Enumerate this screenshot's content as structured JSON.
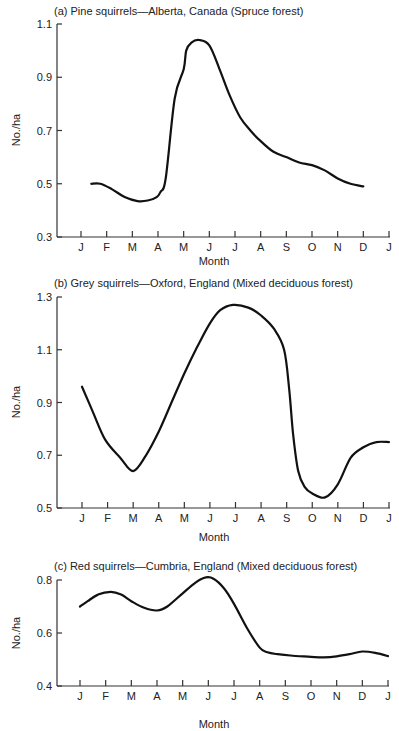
{
  "chart_data": [
    {
      "type": "line",
      "title": "(a)  Pine squirrels—Alberta, Canada (Spruce forest)",
      "xlabel": "Month",
      "ylabel": "No./ha",
      "categories": [
        "J",
        "F",
        "M",
        "A",
        "M",
        "J",
        "J",
        "A",
        "S",
        "O",
        "N",
        "D",
        "J"
      ],
      "ylim": [
        0.3,
        1.1
      ],
      "yticks": [
        "0.3",
        "0.5",
        "0.7",
        "0.9",
        "1.1"
      ],
      "grid": false,
      "x": [
        1.4,
        1.75,
        2.2,
        2.7,
        3.2,
        3.6,
        3.95,
        4.1,
        4.3,
        4.65,
        5.0,
        5.1,
        5.3,
        5.6,
        6.0,
        6.4,
        6.8,
        7.2,
        7.6,
        8.0,
        8.5,
        9.0,
        9.5,
        10.0,
        10.5,
        11.0,
        11.5,
        12.0
      ],
      "values": [
        0.5,
        0.5,
        0.48,
        0.45,
        0.435,
        0.437,
        0.45,
        0.47,
        0.52,
        0.82,
        0.93,
        1.0,
        1.03,
        1.04,
        1.02,
        0.93,
        0.83,
        0.75,
        0.7,
        0.66,
        0.62,
        0.6,
        0.58,
        0.57,
        0.55,
        0.52,
        0.5,
        0.49
      ],
      "frame": {
        "left": 57,
        "right": 390,
        "top": 24,
        "bottom": 237,
        "x_first": 81,
        "x_last": 389,
        "title_y": 15,
        "ticklabel_y": 251,
        "xlabel_y": 265,
        "ylabel_x": 16
      }
    },
    {
      "type": "line",
      "title": "(b)  Grey squirrels—Oxford, England (Mixed deciduous forest)",
      "xlabel": "Month",
      "ylabel": "No./ha",
      "categories": [
        "J",
        "F",
        "M",
        "A",
        "M",
        "J",
        "J",
        "A",
        "S",
        "O",
        "N",
        "D",
        "J"
      ],
      "ylim": [
        0.5,
        1.3
      ],
      "yticks": [
        "0.5",
        "0.7",
        "0.9",
        "1.1",
        "1.3"
      ],
      "grid": false,
      "x": [
        1.0,
        1.4,
        1.9,
        2.5,
        3.0,
        3.5,
        4.0,
        4.5,
        5.0,
        5.5,
        6.0,
        6.4,
        6.9,
        7.5,
        8.0,
        8.5,
        8.9,
        9.1,
        9.25,
        9.45,
        9.7,
        10.0,
        10.5,
        11.0,
        11.5,
        12.0,
        12.5,
        13.0
      ],
      "values": [
        0.96,
        0.87,
        0.76,
        0.69,
        0.64,
        0.7,
        0.79,
        0.9,
        1.01,
        1.11,
        1.2,
        1.25,
        1.27,
        1.26,
        1.23,
        1.18,
        1.1,
        0.95,
        0.78,
        0.64,
        0.58,
        0.555,
        0.54,
        0.59,
        0.69,
        0.73,
        0.75,
        0.75
      ],
      "frame": {
        "left": 57,
        "right": 390,
        "top": 297,
        "bottom": 508,
        "x_first": 82,
        "x_last": 389,
        "title_y": 287,
        "ticklabel_y": 522,
        "xlabel_y": 541,
        "ylabel_x": 16
      }
    },
    {
      "type": "line",
      "title": "(c)  Red squirrels—Cumbria, England (Mixed deciduous forest)",
      "xlabel": "Month",
      "ylabel": "No./ha",
      "categories": [
        "J",
        "F",
        "M",
        "A",
        "M",
        "J",
        "J",
        "A",
        "S",
        "O",
        "N",
        "D",
        "J"
      ],
      "ylim": [
        0.4,
        0.8
      ],
      "yticks": [
        "0.4",
        "0.6",
        "0.8"
      ],
      "grid": false,
      "x": [
        1.0,
        1.3,
        1.7,
        2.2,
        2.6,
        3.0,
        3.5,
        4.0,
        4.4,
        5.0,
        5.5,
        5.9,
        6.2,
        6.6,
        7.0,
        7.5,
        8.0,
        8.3,
        8.7,
        9.2,
        10.0,
        10.5,
        11.0,
        11.5,
        12.0,
        12.5,
        13.0
      ],
      "values": [
        0.7,
        0.72,
        0.745,
        0.755,
        0.745,
        0.72,
        0.695,
        0.685,
        0.7,
        0.75,
        0.79,
        0.81,
        0.805,
        0.77,
        0.71,
        0.62,
        0.545,
        0.527,
        0.52,
        0.515,
        0.51,
        0.508,
        0.512,
        0.52,
        0.53,
        0.525,
        0.513
      ],
      "frame": {
        "left": 57,
        "right": 390,
        "top": 580,
        "bottom": 686,
        "x_first": 80,
        "x_last": 388,
        "title_y": 570,
        "ticklabel_y": 700,
        "xlabel_y": 728,
        "ylabel_x": 16
      }
    }
  ],
  "charts": [
    {
      "title": "(a)  Pine squirrels—Alberta, Canada (Spruce forest)",
      "xlabel": "Month",
      "ylabel": "No./ha"
    },
    {
      "title": "(b)  Grey squirrels—Oxford, England (Mixed deciduous forest)",
      "xlabel": "Month",
      "ylabel": "No./ha"
    },
    {
      "title": "(c)  Red squirrels—Cumbria, England (Mixed deciduous forest)",
      "xlabel": "Month",
      "ylabel": "No./ha"
    }
  ]
}
